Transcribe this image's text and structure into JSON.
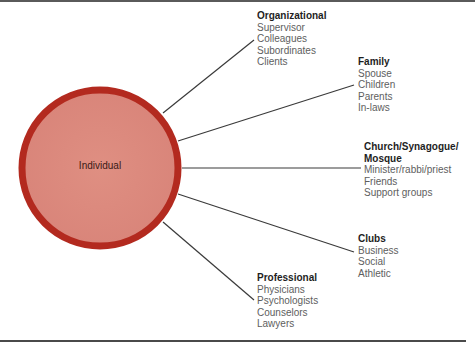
{
  "diagram": {
    "center": {
      "label": "Individual"
    },
    "colors": {
      "circle_fill": "#dd8b7e",
      "circle_ring": "#b32a1f",
      "connector": "#3a3a3a",
      "heading_text": "#1e1e1e",
      "item_text": "#5e5e5e"
    },
    "groups": [
      {
        "id": "organizational",
        "heading": "Organizational",
        "items": [
          "Supervisor",
          "Colleagues",
          "Subordinates",
          "Clients"
        ]
      },
      {
        "id": "family",
        "heading": "Family",
        "items": [
          "Spouse",
          "Children",
          "Parents",
          "In-laws"
        ]
      },
      {
        "id": "church",
        "heading_lines": [
          "Church/Synagogue/",
          "Mosque"
        ],
        "items": [
          "Minister/rabbi/priest",
          "Friends",
          "Support groups"
        ]
      },
      {
        "id": "clubs",
        "heading": "Clubs",
        "items": [
          "Business",
          "Social",
          "Athletic"
        ]
      },
      {
        "id": "professional",
        "heading": "Professional",
        "items": [
          "Physicians",
          "Psychologists",
          "Counselors",
          "Lawyers"
        ]
      }
    ]
  }
}
